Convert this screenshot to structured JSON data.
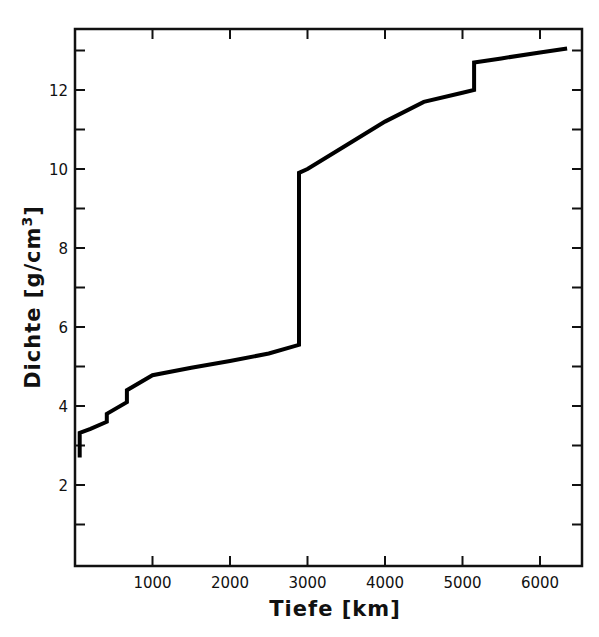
{
  "chart_data": {
    "type": "line",
    "title": "",
    "xlabel": "Tiefe [km]",
    "ylabel": "Dichte [g/cm³]",
    "ylabel_parts": {
      "main": "Dichte [g/cm",
      "sup": "3",
      "close": "]"
    },
    "xlim": [
      0,
      6500
    ],
    "ylim": [
      0,
      13.6
    ],
    "x_ticks": [
      1000,
      2000,
      3000,
      4000,
      5000,
      6000
    ],
    "x_tick_labels": [
      "1000",
      "2000",
      "3000",
      "4000",
      "5000",
      "6000"
    ],
    "x_minor_ticks": [],
    "y_ticks": [
      2,
      4,
      6,
      8,
      10,
      12
    ],
    "y_tick_labels": [
      "2",
      "4",
      "6",
      "8",
      "10",
      "12"
    ],
    "y_minor_ticks": [
      1,
      3,
      5,
      7,
      9,
      11,
      13
    ],
    "grid": false,
    "legend": null,
    "series": [
      {
        "name": "Dichte",
        "color": "#000000",
        "x": [
          60,
          60,
          200,
          410,
          410,
          670,
          670,
          1000,
          1500,
          2000,
          2500,
          2890,
          2890,
          3000,
          3500,
          4000,
          4500,
          5000,
          5150,
          5150,
          5500,
          6000,
          6350
        ],
        "y": [
          2.7,
          3.32,
          3.42,
          3.6,
          3.8,
          4.1,
          4.4,
          4.78,
          4.97,
          5.14,
          5.33,
          5.55,
          9.9,
          10.0,
          10.6,
          11.2,
          11.7,
          11.93,
          12.0,
          12.7,
          12.8,
          12.95,
          13.05
        ]
      }
    ]
  }
}
